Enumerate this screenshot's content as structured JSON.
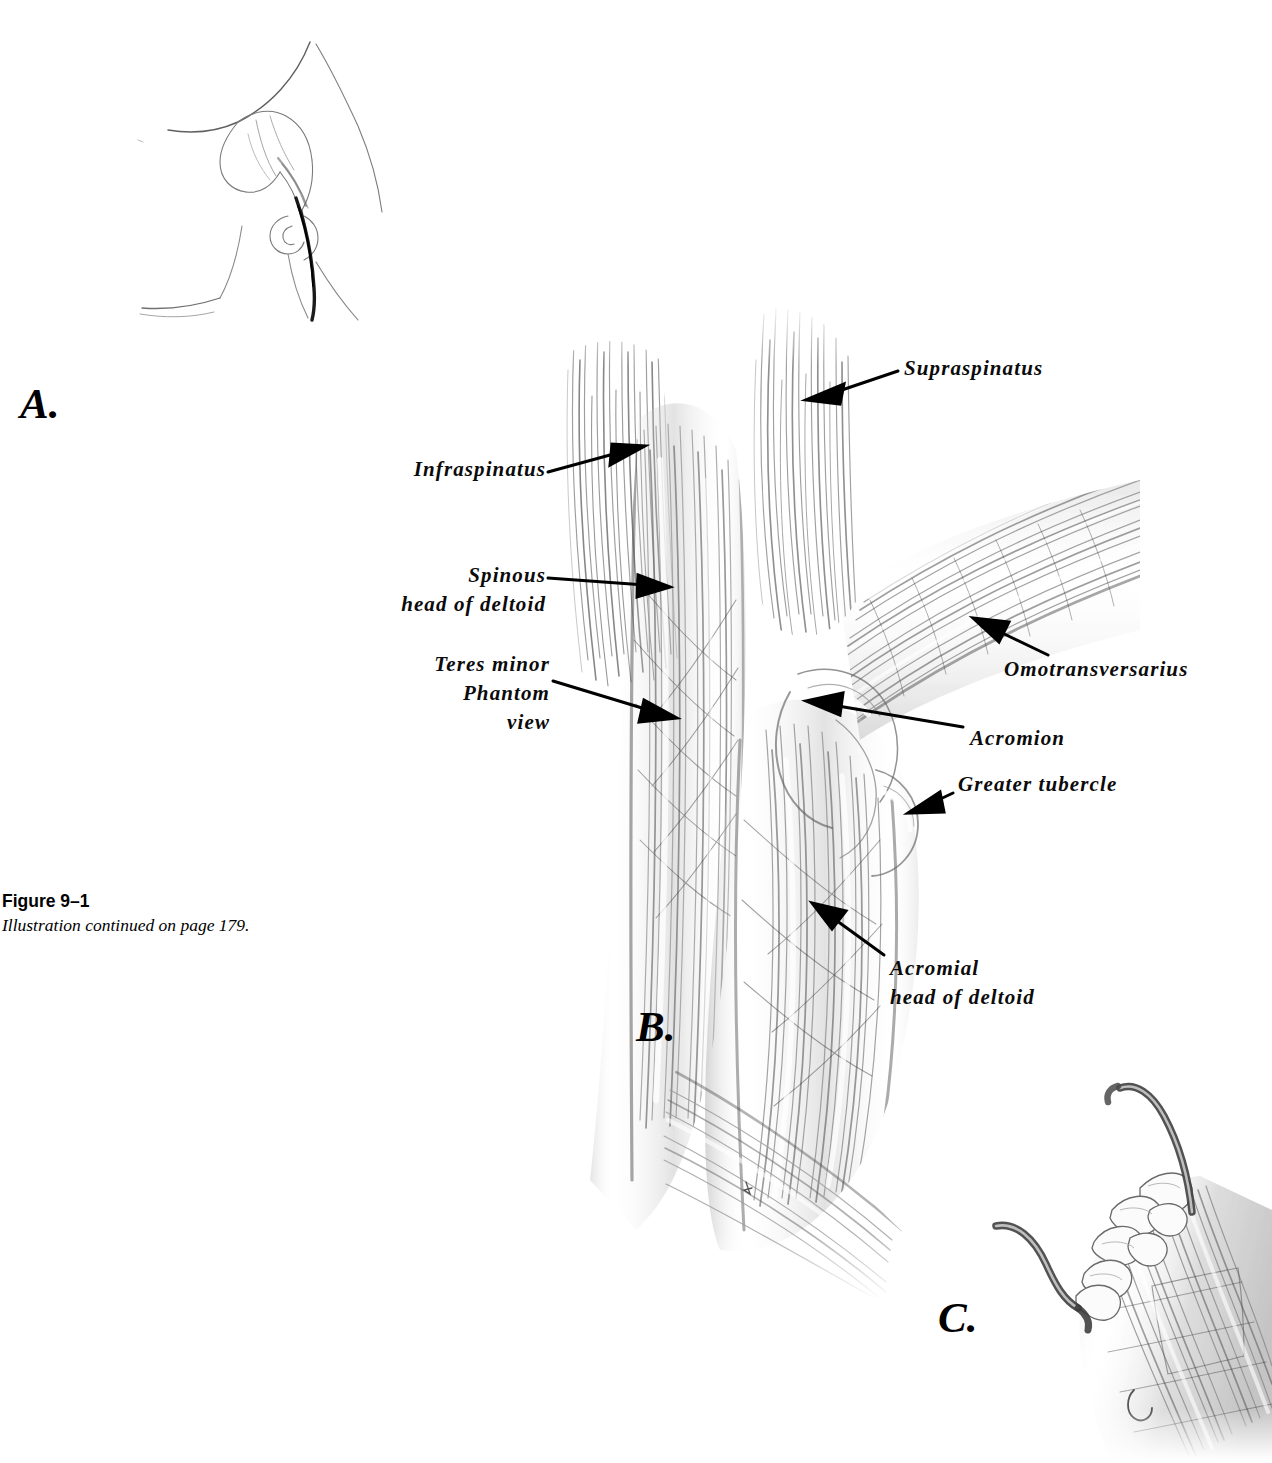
{
  "figure": {
    "caption_title": "Figure 9–1",
    "caption_subtitle": "Illustration continued on page 179.",
    "panels": [
      {
        "id": "A",
        "letter": "A.",
        "description": "pencil line sketch of shoulder region orientation with incision line"
      },
      {
        "id": "B",
        "letter": "B.",
        "description": "main graphite rendering of superficial shoulder musculature"
      },
      {
        "id": "C",
        "letter": "C.",
        "description": "detail of muscle belly with retractor hooks and nodular fat"
      }
    ]
  },
  "labels": [
    {
      "id": "supraspinatus",
      "text": [
        "Supraspinatus"
      ],
      "align": "left"
    },
    {
      "id": "infraspinatus",
      "text": [
        "Infraspinatus"
      ],
      "align": "right"
    },
    {
      "id": "spinous-head",
      "text": [
        "Spinous",
        "head of deltoid"
      ],
      "align": "right"
    },
    {
      "id": "teres-minor",
      "text": [
        "Teres minor",
        "Phantom",
        "view"
      ],
      "align": "right"
    },
    {
      "id": "omotransversarius",
      "text": [
        "Omotransversarius"
      ],
      "align": "left"
    },
    {
      "id": "acromion",
      "text": [
        "Acromion"
      ],
      "align": "left"
    },
    {
      "id": "greater-tubercle",
      "text": [
        "Greater tubercle"
      ],
      "align": "left"
    },
    {
      "id": "acromial-head",
      "text": [
        "Acromial",
        "head of deltoid"
      ],
      "align": "left"
    }
  ],
  "label_text": {
    "supraspinatus": "Supraspinatus",
    "infraspinatus": "Infraspinatus",
    "spinous_1": "Spinous",
    "spinous_2": "head of deltoid",
    "teres_1": "Teres minor",
    "teres_2": "Phantom",
    "teres_3": "view",
    "omotransversarius": "Omotransversarius",
    "acromion": "Acromion",
    "greater_tubercle": "Greater tubercle",
    "acromial_1": "Acromial",
    "acromial_2": "head of deltoid"
  },
  "panel_letters": {
    "a": "A.",
    "b": "B.",
    "c": "C."
  },
  "colors": {
    "background": "#ffffff",
    "ink": "#0b0b0b",
    "graphite_dark": "#4a4a4a",
    "graphite_mid": "#8a8a8a",
    "graphite_light": "#c9c9c9",
    "sketch_line": "#6b6b6b"
  }
}
